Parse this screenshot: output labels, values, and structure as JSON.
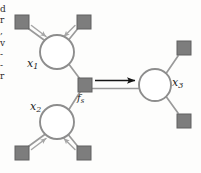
{
  "figure": {
    "type": "factor-graph",
    "background_color": "#fdfdfc",
    "node_stroke_color": "#8a8a8a",
    "node_fill_color": "#ffffff",
    "factor_fill_color": "#7d7d7d",
    "factor_stroke_color": "#5d5d5d",
    "edge_color": "#9a9a9a",
    "message_arrow_color": "#a8a8a8",
    "main_arrow_color": "#1a1a1a"
  },
  "margin_text": {
    "lines": "d\nr\n,\nv\n-\n-\nr"
  },
  "variable_nodes": [
    {
      "id": "x1",
      "label": "x",
      "subscript": "1",
      "cx": 57,
      "cy": 52,
      "r": 17
    },
    {
      "id": "x2",
      "label": "x",
      "subscript": "2",
      "cx": 57,
      "cy": 122,
      "r": 17
    },
    {
      "id": "x3",
      "label": "x",
      "subscript": "3",
      "cx": 155,
      "cy": 85,
      "r": 16
    }
  ],
  "factor_nodes": [
    {
      "id": "fs",
      "label": "f",
      "subscript": "s",
      "cx": 85,
      "cy": 85,
      "size": 14
    },
    {
      "id": "leaf-top-left",
      "label": "",
      "subscript": "",
      "cx": 22,
      "cy": 22,
      "size": 14
    },
    {
      "id": "leaf-top-right",
      "label": "",
      "subscript": "",
      "cx": 84,
      "cy": 22,
      "size": 14
    },
    {
      "id": "leaf-bottom-left",
      "label": "",
      "subscript": "",
      "cx": 22,
      "cy": 153,
      "size": 14
    },
    {
      "id": "leaf-bottom-right",
      "label": "",
      "subscript": "",
      "cx": 84,
      "cy": 153,
      "size": 14
    },
    {
      "id": "leaf-right-top",
      "label": "",
      "subscript": "",
      "cx": 184,
      "cy": 48,
      "size": 14
    },
    {
      "id": "leaf-right-bottom",
      "label": "",
      "subscript": "",
      "cx": 184,
      "cy": 121,
      "size": 14
    }
  ],
  "edges": [
    {
      "from": "leaf-top-left",
      "to": "x1"
    },
    {
      "from": "leaf-top-right",
      "to": "x1"
    },
    {
      "from": "x1",
      "to": "fs"
    },
    {
      "from": "leaf-bottom-left",
      "to": "x2"
    },
    {
      "from": "leaf-bottom-right",
      "to": "x2"
    },
    {
      "from": "x2",
      "to": "fs"
    },
    {
      "from": "fs",
      "to": "x3"
    },
    {
      "from": "x3",
      "to": "leaf-right-top"
    },
    {
      "from": "x3",
      "to": "leaf-right-bottom"
    }
  ],
  "messages": [
    {
      "id": "msg-tl-x1",
      "target": "x1",
      "direction": "incoming",
      "style": "double-line-gray"
    },
    {
      "id": "msg-tr-x1",
      "target": "x1",
      "direction": "incoming",
      "style": "double-line-gray"
    },
    {
      "id": "msg-bl-x2",
      "target": "x2",
      "direction": "incoming",
      "style": "double-line-gray"
    },
    {
      "id": "msg-br-x2",
      "target": "x2",
      "direction": "incoming",
      "style": "double-line-gray"
    },
    {
      "id": "msg-fs-x3",
      "target": "x3",
      "direction": "outgoing",
      "style": "solid-black-arrow"
    }
  ]
}
